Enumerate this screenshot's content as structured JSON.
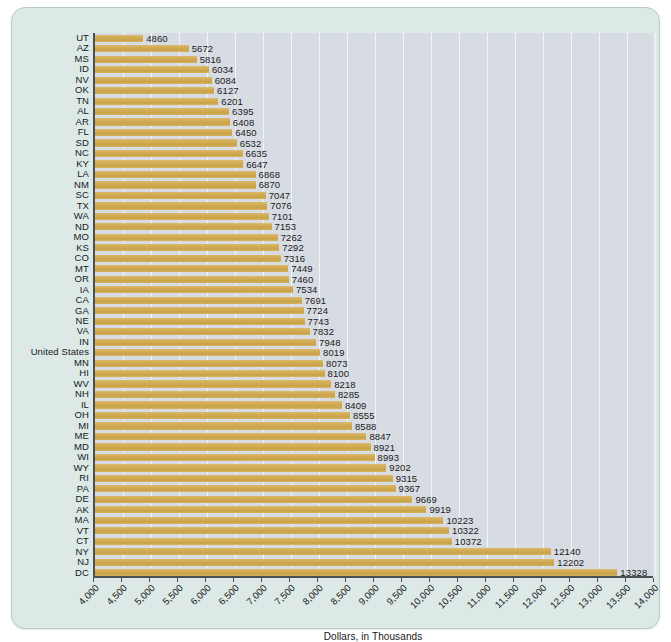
{
  "chart_data": {
    "type": "bar",
    "orientation": "horizontal",
    "title": "",
    "xlabel": "Dollars, in Thousands",
    "ylabel": "",
    "xlim": [
      4000,
      14000
    ],
    "xticks": [
      "4,000",
      "4,500",
      "5,000",
      "5,500",
      "6,000",
      "6,500",
      "7,000",
      "7,500",
      "8,000",
      "8,500",
      "9,000",
      "9,500",
      "10,000",
      "10,500",
      "11,000",
      "11,500",
      "12,000",
      "12,500",
      "13,000",
      "13,500",
      "14,000"
    ],
    "xtick_values": [
      4000,
      4500,
      5000,
      5500,
      6000,
      6500,
      7000,
      7500,
      8000,
      8500,
      9000,
      9500,
      10000,
      10500,
      11000,
      11500,
      12000,
      12500,
      13000,
      13500,
      14000
    ],
    "grid": "vertical",
    "legend": "none",
    "bar_color": "#d2ac55",
    "plot_background": "#d7dce2",
    "page_background": "#dde9e6",
    "categories": [
      "UT",
      "AZ",
      "MS",
      "ID",
      "NV",
      "OK",
      "TN",
      "AL",
      "AR",
      "FL",
      "SD",
      "NC",
      "KY",
      "LA",
      "NM",
      "SC",
      "TX",
      "WA",
      "ND",
      "MO",
      "KS",
      "CO",
      "MT",
      "OR",
      "IA",
      "CA",
      "GA",
      "NE",
      "VA",
      "IN",
      "United States",
      "MN",
      "HI",
      "WV",
      "NH",
      "IL",
      "OH",
      "MI",
      "ME",
      "MD",
      "WI",
      "WY",
      "RI",
      "PA",
      "DE",
      "AK",
      "MA",
      "VT",
      "CT",
      "NY",
      "NJ",
      "DC"
    ],
    "values": [
      4860,
      5672,
      5816,
      6034,
      6084,
      6127,
      6201,
      6395,
      6408,
      6450,
      6532,
      6635,
      6647,
      6868,
      6870,
      7047,
      7076,
      7101,
      7153,
      7262,
      7292,
      7316,
      7449,
      7460,
      7534,
      7691,
      7724,
      7743,
      7832,
      7948,
      8019,
      8073,
      8100,
      8218,
      8285,
      8409,
      8555,
      8588,
      8847,
      8921,
      8993,
      9202,
      9315,
      9367,
      9669,
      9919,
      10223,
      10322,
      10372,
      12140,
      12202,
      13328
    ],
    "value_labels": [
      "4860",
      "5672",
      "5816",
      "6034",
      "6084",
      "6127",
      "6201",
      "6395",
      "6408",
      "6450",
      "6532",
      "6635",
      "6647",
      "6868",
      "6870",
      "7047",
      "7076",
      "7101",
      "7153",
      "7262",
      "7292",
      "7316",
      "7449",
      "7460",
      "7534",
      "7691",
      "7724",
      "7743",
      "7832",
      "7948",
      "8019",
      "8073",
      "8100",
      "8218",
      "8285",
      "8409",
      "8555",
      "8588",
      "8847",
      "8921",
      "8993",
      "9202",
      "9315",
      "9367",
      "9669",
      "9919",
      "10223",
      "10322",
      "10372",
      "12140",
      "12202",
      "13328"
    ]
  }
}
